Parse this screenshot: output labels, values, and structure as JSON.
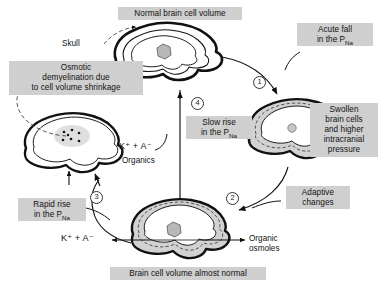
{
  "figure": {
    "caption_top": "Normal brain cell volume",
    "caption_bottom": "Brain cell volume almost normal"
  },
  "labels": {
    "normal_volume": "Normal brain cell volume",
    "skull": "Skull",
    "acute_fall": "Acute fall\nin the P",
    "acute_fall_sub": "Na",
    "swollen": "Swollen\nbrain cells\nand higher\nintracranial\npressure",
    "adaptive": "Adaptive\nchanges",
    "almost_normal": "Brain cell volume almost normal",
    "rapid_rise": "Rapid rise\nin the P",
    "rapid_rise_sub": "Na",
    "slow_rise": "Slow rise\nin the P",
    "slow_rise_sub": "Na",
    "osmotic": "Osmotic\ndemyelination due\nto cell volume shrinkage",
    "organic_osmoles": "Organic\nosmoles",
    "organics": "Organics"
  },
  "chem": {
    "k_a_mid": "K⁺ + A⁻",
    "k_a_bottom": "K⁺ + A⁻"
  },
  "steps": {
    "one": "1",
    "two": "2",
    "three": "3",
    "four": "4"
  },
  "colors": {
    "label_bg": "#cfcfcf",
    "nucleus_fill": "#b8b8b8",
    "cell_band": "#d2d2d2",
    "stroke": "#111111",
    "dash": "#555555"
  }
}
